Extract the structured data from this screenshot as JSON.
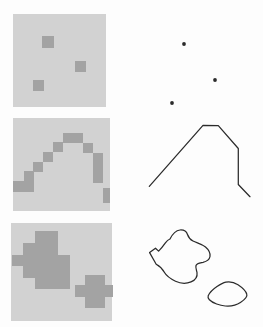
{
  "figure": {
    "background": "#fdfdfd",
    "panel_fill": "#d2d2d2",
    "pixel_fill": "#a3a3a3",
    "stroke": "#2b2b2b",
    "dot_radius": 1.9,
    "line_width": 1.25,
    "panels": [
      {
        "id": "raster-points-panel",
        "type": "raster",
        "x": 13,
        "y": 14,
        "w": 93,
        "h": 93,
        "cells": [
          {
            "x": 29,
            "y": 22,
            "w": 12,
            "h": 12
          },
          {
            "x": 62,
            "y": 47,
            "w": 11,
            "h": 11
          },
          {
            "x": 20,
            "y": 66,
            "w": 11,
            "h": 11
          }
        ]
      },
      {
        "id": "vector-points-panel",
        "type": "points",
        "dots": [
          {
            "cx": 184,
            "cy": 44
          },
          {
            "cx": 215,
            "cy": 80
          },
          {
            "cx": 172,
            "cy": 103
          }
        ]
      },
      {
        "id": "raster-curve-panel",
        "type": "raster",
        "x": 13,
        "y": 118,
        "w": 97,
        "h": 93,
        "cells": [
          {
            "x": 0,
            "y": 63,
            "w": 11,
            "h": 11
          },
          {
            "x": 11,
            "y": 53,
            "w": 10,
            "h": 21
          },
          {
            "x": 20,
            "y": 44,
            "w": 10,
            "h": 10
          },
          {
            "x": 30,
            "y": 34,
            "w": 10,
            "h": 10
          },
          {
            "x": 40,
            "y": 24,
            "w": 10,
            "h": 10
          },
          {
            "x": 50,
            "y": 15,
            "w": 20,
            "h": 10
          },
          {
            "x": 70,
            "y": 25,
            "w": 10,
            "h": 10
          },
          {
            "x": 80,
            "y": 35,
            "w": 10,
            "h": 30
          },
          {
            "x": 90,
            "y": 70,
            "w": 7,
            "h": 15
          }
        ]
      },
      {
        "id": "vector-curve-panel",
        "type": "polyline",
        "points": [
          [
            149.3,
            186.3
          ],
          [
            203,
            125.3
          ],
          [
            218.3,
            125.7
          ],
          [
            238.3,
            148.5
          ],
          [
            238.3,
            184.5
          ],
          [
            250,
            196.7
          ]
        ]
      },
      {
        "id": "raster-regions-panel",
        "type": "raster",
        "x": 11,
        "y": 223,
        "w": 101,
        "h": 98,
        "cells": [
          {
            "x": 24,
            "y": 8,
            "w": 23,
            "h": 12
          },
          {
            "x": 12,
            "y": 20,
            "w": 35,
            "h": 12
          },
          {
            "x": 1,
            "y": 32,
            "w": 58,
            "h": 11
          },
          {
            "x": 12,
            "y": 43,
            "w": 47,
            "h": 12
          },
          {
            "x": 24,
            "y": 55,
            "w": 35,
            "h": 11
          },
          {
            "x": 74,
            "y": 52,
            "w": 20,
            "h": 10
          },
          {
            "x": 64,
            "y": 62,
            "w": 38,
            "h": 12
          },
          {
            "x": 74,
            "y": 74,
            "w": 20,
            "h": 11
          }
        ]
      },
      {
        "id": "vector-regions-panel",
        "type": "paths",
        "paths": [
          "M170,239 C173,233 176,230.5 180,230 C184,229.7 186.5,231.5 187.5,234.5 C188.5,237.5 190,239.5 193,241 C197,243 202,244 205.5,247 C209,250 210.5,253 210,256.5 C209.5,259.5 206.5,261.5 203,262.3 C199.5,263 196.8,263.2 196,265.5 C195.3,267.5 196.5,270 197,272.5 C197.6,276.5 195.5,280 191,281.9 C186.5,283.7 180,283.3 175.5,281.2 C171,279 166.5,276 164.5,272.5 C162.7,269.3 160.3,266.5 156.2,264.3 L149.6,252.6 L155.5,248.2 L158.6,251.1 C161,248.7 163.4,245.6 165.4,242.8 C166.9,240.7 168.3,239.5 170,239 Z",
          "M208.2,295.8 C209.8,292.4 213,289.3 217,286.6 C219.8,284.7 222.8,282.8 225.8,282.2 C229.8,281.4 234.6,282.6 238,284.8 C241.6,287.2 245.8,290.8 246.8,294.2 C247.6,296.6 244.4,299.8 240.4,302.6 C236.6,305.2 230.4,306.4 225.2,306 C220.2,305.6 212.6,303.2 209.4,299.8 C208.2,298.4 207.6,297.2 208.2,295.8 Z"
        ]
      }
    ]
  }
}
